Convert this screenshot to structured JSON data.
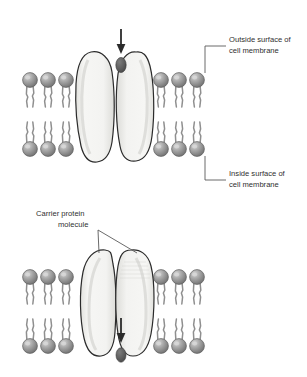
{
  "figure": {
    "panels": [
      {
        "id": "panel-top",
        "caption": "Molecule approaching the open carrier protein from outside the cell"
      },
      {
        "id": "panel-bottom",
        "caption": "Molecule released to the inside of the cell after the carrier protein closes"
      }
    ]
  },
  "labels": {
    "outside_surface": {
      "line1": "Outside surface of",
      "line2": "cell membrane"
    },
    "inside_surface": {
      "line1": "Inside surface of",
      "line2": "cell membrane"
    },
    "carrier_protein": {
      "line1": "Carrier protein",
      "line2": "molecule"
    }
  },
  "colors": {
    "background": "#ffffff",
    "outline": "#2b2b2b",
    "phospholipid_head": "#9a9a9a",
    "phospholipid_head_highlight": "#c8c8c8",
    "phospholipid_head_shadow": "#6e6e6e",
    "lipid_tail": "#8f8f8f",
    "protein_fill": "#f2f2f0",
    "protein_shadow": "#d8d8d4",
    "transported_molecule": "#595959",
    "arrow": "#2b2b2b",
    "leader_line": "#5a5a5a",
    "text": "#2f2f2f"
  },
  "elements": {
    "arrow_top": {
      "direction": "down",
      "meaning": "molecule entering from outside"
    },
    "arrow_bottom": {
      "direction": "down",
      "meaning": "molecule exiting to inside"
    },
    "molecule_top": {
      "shape": "ellipse",
      "position": "outside the membrane, above the open channel"
    },
    "molecule_bottom": {
      "shape": "ellipse",
      "position": "inside the cell, below the closed channel"
    },
    "bilayer": {
      "rows": 2,
      "heads_per_row_per_side": 3,
      "sides": 2
    }
  }
}
